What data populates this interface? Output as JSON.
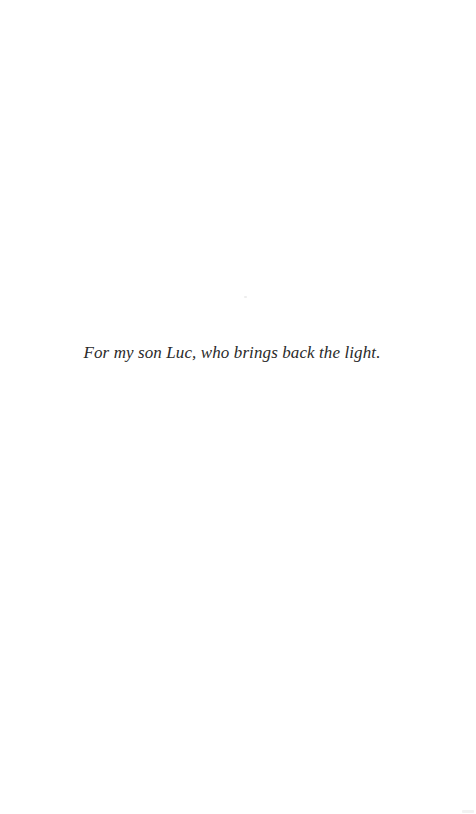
{
  "page": {
    "type": "dedication",
    "background_color": "#ffffff",
    "text_color": "#2a2a2a",
    "dedication_text": "For my son Luc, who brings back the light."
  }
}
